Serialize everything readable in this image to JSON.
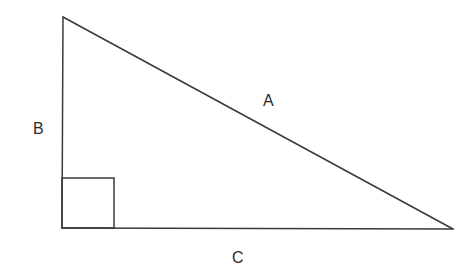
{
  "diagram": {
    "type": "right-triangle",
    "stroke_color": "#3a3a3a",
    "background": "#ffffff",
    "vertices": {
      "top": [
        63,
        17
      ],
      "right_angle": [
        62,
        228
      ],
      "far": [
        453,
        229
      ]
    },
    "right_angle_marker": {
      "x": 62,
      "y": 178,
      "size": 51
    },
    "labels": {
      "hypotenuse": "A",
      "vertical_leg": "B",
      "horizontal_leg": "C"
    }
  }
}
